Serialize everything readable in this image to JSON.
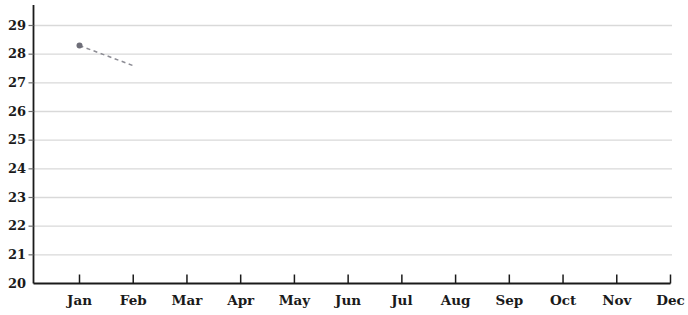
{
  "chart_data": {
    "type": "line",
    "title": "",
    "xlabel": "",
    "ylabel": "",
    "categories": [
      "Jan",
      "Feb",
      "Mar",
      "Apr",
      "May",
      "Jun",
      "Jul",
      "Aug",
      "Sep",
      "Oct",
      "Nov",
      "Dec"
    ],
    "ytick_labels": [
      "20",
      "21",
      "22",
      "23",
      "24",
      "25",
      "26",
      "27",
      "28",
      "29"
    ],
    "yticks": [
      20,
      21,
      22,
      23,
      24,
      25,
      26,
      27,
      28,
      29
    ],
    "ylim": [
      20,
      29.7
    ],
    "xlim": [
      0,
      12.6
    ],
    "grid": true,
    "grid_axis": "y",
    "grid_color": "#d9d9d9",
    "legend": "none",
    "axis_color": "#1a1a1a",
    "series": [
      {
        "name": "series-1",
        "style": "dashed",
        "color": "#8c8c94",
        "marker": "circle",
        "marker_color": "#6e6e78",
        "x": [
          "Jan",
          "Feb"
        ],
        "values": [
          28.3,
          27.6
        ],
        "points": [
          {
            "category": "Jan",
            "value": 28.3,
            "marker": true
          },
          {
            "category": "Feb",
            "value": 27.6,
            "marker": false
          }
        ]
      }
    ]
  },
  "axes": {
    "y_axis_name": "y-axis",
    "x_axis_name": "x-axis"
  }
}
